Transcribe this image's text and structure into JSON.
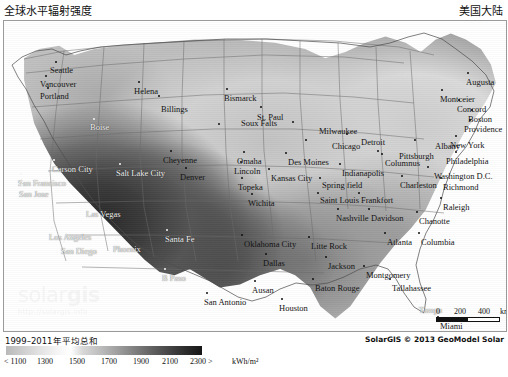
{
  "header": {
    "title_left": "全球水平辐射强度",
    "title_right": "美国大陆"
  },
  "map": {
    "watermark_brand_a": "solar",
    "watermark_brand_b": "gis",
    "watermark_url": "http://solargis.info",
    "cities": [
      {
        "name": "Seattle",
        "x": 52,
        "y": 41,
        "dx": -6,
        "dy": 4,
        "light": false
      },
      {
        "name": "Vancouver",
        "x": 42,
        "y": 55,
        "dx": -6,
        "dy": 4,
        "light": false
      },
      {
        "name": "Portland",
        "x": 44,
        "y": 67,
        "dx": -8,
        "dy": 4,
        "light": false
      },
      {
        "name": "Helena",
        "x": 135,
        "y": 61,
        "dx": -5,
        "dy": 5,
        "light": false
      },
      {
        "name": "Billings",
        "x": 155,
        "y": 75,
        "dx": 2,
        "dy": 9,
        "light": false
      },
      {
        "name": "Bismarck",
        "x": 223,
        "y": 68,
        "dx": -3,
        "dy": 5,
        "light": false
      },
      {
        "name": "St. Paul",
        "x": 257,
        "y": 86,
        "dx": -4,
        "dy": 6,
        "light": false
      },
      {
        "name": "Soux Falts",
        "x": 215,
        "y": 103,
        "dx": 22,
        "dy": -5,
        "light": false
      },
      {
        "name": "Milwaukee",
        "x": 289,
        "y": 101,
        "dx": 26,
        "dy": 5,
        "light": false
      },
      {
        "name": "Detroit",
        "x": 343,
        "y": 113,
        "dx": 14,
        "dy": 4,
        "light": false
      },
      {
        "name": "Boise",
        "x": 90,
        "y": 98,
        "dx": -4,
        "dy": 4,
        "light": true
      },
      {
        "name": "Chicago",
        "x": 302,
        "y": 119,
        "dx": 26,
        "dy": 2,
        "light": false
      },
      {
        "name": "Pittsburgh",
        "x": 374,
        "y": 130,
        "dx": 21,
        "dy": 1,
        "light": false
      },
      {
        "name": "Albany",
        "x": 411,
        "y": 119,
        "dx": 20,
        "dy": 2,
        "light": false
      },
      {
        "name": "Augusta",
        "x": 464,
        "y": 52,
        "dx": -2,
        "dy": 5,
        "light": false
      },
      {
        "name": "Montceier",
        "x": 438,
        "y": 69,
        "dx": -2,
        "dy": 5,
        "light": false
      },
      {
        "name": "Concord",
        "x": 455,
        "y": 79,
        "dx": -2,
        "dy": 5,
        "light": false
      },
      {
        "name": "Boston",
        "x": 468,
        "y": 89,
        "dx": -4,
        "dy": 5,
        "light": false
      },
      {
        "name": "Providence",
        "x": 466,
        "y": 99,
        "dx": -6,
        "dy": 5,
        "light": false
      },
      {
        "name": "New York",
        "x": 452,
        "y": 115,
        "dx": -6,
        "dy": 5,
        "light": false
      },
      {
        "name": "Philadelphia",
        "x": 452,
        "y": 131,
        "dx": -10,
        "dy": 5,
        "light": false
      },
      {
        "name": "Cheyenne",
        "x": 167,
        "y": 130,
        "dx": -8,
        "dy": 5,
        "light": false
      },
      {
        "name": "Omaha",
        "x": 240,
        "y": 131,
        "dx": -7,
        "dy": 5,
        "light": false
      },
      {
        "name": "Des Moines",
        "x": 282,
        "y": 132,
        "dx": 2,
        "dy": 5,
        "light": false
      },
      {
        "name": "Columnus",
        "x": 378,
        "y": 133,
        "dx": 3,
        "dy": 5,
        "light": false
      },
      {
        "name": "Salt Lake City",
        "x": 116,
        "y": 143,
        "dx": -4,
        "dy": 5,
        "light": true
      },
      {
        "name": "Lincoln",
        "x": 237,
        "y": 141,
        "dx": -7,
        "dy": 5,
        "light": false
      },
      {
        "name": "Denver",
        "x": 182,
        "y": 147,
        "dx": -6,
        "dy": 5,
        "light": false
      },
      {
        "name": "Indianapolis",
        "x": 336,
        "y": 143,
        "dx": 2,
        "dy": 5,
        "light": false
      },
      {
        "name": "Carson City",
        "x": 50,
        "y": 139,
        "dx": -2,
        "dy": 5,
        "light": true
      },
      {
        "name": "San Francisco",
        "x": 17,
        "y": 153,
        "dx": -3,
        "dy": 5,
        "light": true
      },
      {
        "name": "Washington D.C.",
        "x": 424,
        "y": 146,
        "dx": 6,
        "dy": 5,
        "light": false
      },
      {
        "name": "Topeka",
        "x": 238,
        "y": 157,
        "dx": -4,
        "dy": 5,
        "light": false
      },
      {
        "name": "Kansas City",
        "x": 265,
        "y": 148,
        "dx": 2,
        "dy": 5,
        "light": false
      },
      {
        "name": "Spring field",
        "x": 316,
        "y": 157,
        "dx": 2,
        "dy": 3,
        "light": false
      },
      {
        "name": "Charleston",
        "x": 398,
        "y": 155,
        "dx": -2,
        "dy": 5,
        "light": false
      },
      {
        "name": "Richmond",
        "x": 437,
        "y": 157,
        "dx": 2,
        "dy": 5,
        "light": false
      },
      {
        "name": "San Jose",
        "x": 18,
        "y": 164,
        "dx": -3,
        "dy": 5,
        "light": true
      },
      {
        "name": "Saint Louis",
        "x": 314,
        "y": 172,
        "dx": 2,
        "dy": 3,
        "light": false
      },
      {
        "name": "Frankfort",
        "x": 355,
        "y": 172,
        "dx": 2,
        "dy": 3,
        "light": false
      },
      {
        "name": "Wichita",
        "x": 248,
        "y": 173,
        "dx": -4,
        "dy": 5,
        "light": false
      },
      {
        "name": "Raleigh",
        "x": 437,
        "y": 177,
        "dx": 2,
        "dy": 5,
        "light": false
      },
      {
        "name": "Las Vegas",
        "x": 86,
        "y": 184,
        "dx": -4,
        "dy": 5,
        "light": true
      },
      {
        "name": "Nashville",
        "x": 334,
        "y": 188,
        "dx": -2,
        "dy": 5,
        "light": false
      },
      {
        "name": "Davidson",
        "x": 365,
        "y": 188,
        "dx": 2,
        "dy": 5,
        "light": false
      },
      {
        "name": "Chanotte",
        "x": 413,
        "y": 191,
        "dx": 2,
        "dy": 5,
        "light": false
      },
      {
        "name": "Los Angeles",
        "x": 48,
        "y": 207,
        "dx": -3,
        "dy": 5,
        "light": true
      },
      {
        "name": "Santa Fe",
        "x": 163,
        "y": 209,
        "dx": -2,
        "dy": 5,
        "light": true
      },
      {
        "name": "Oklahoma City",
        "x": 238,
        "y": 214,
        "dx": 2,
        "dy": 5,
        "light": false
      },
      {
        "name": "Litte Rock",
        "x": 305,
        "y": 216,
        "dx": 2,
        "dy": 5,
        "light": false
      },
      {
        "name": "Atlanta",
        "x": 381,
        "y": 212,
        "dx": 2,
        "dy": 5,
        "light": false
      },
      {
        "name": "Columbia",
        "x": 415,
        "y": 212,
        "dx": 2,
        "dy": 5,
        "light": false
      },
      {
        "name": "Phoenix",
        "x": 112,
        "y": 219,
        "dx": -3,
        "dy": 5,
        "light": true
      },
      {
        "name": "San Diego",
        "x": 60,
        "y": 221,
        "dx": -3,
        "dy": 5,
        "light": true
      },
      {
        "name": "Dallas",
        "x": 262,
        "y": 233,
        "dx": -3,
        "dy": 5,
        "light": false
      },
      {
        "name": "Jackson",
        "x": 322,
        "y": 236,
        "dx": 2,
        "dy": 5,
        "light": false
      },
      {
        "name": "B Paso",
        "x": 161,
        "y": 248,
        "dx": -3,
        "dy": 5,
        "light": true
      },
      {
        "name": "Montgomery",
        "x": 360,
        "y": 245,
        "dx": 2,
        "dy": 5,
        "light": false
      },
      {
        "name": "Ausan",
        "x": 251,
        "y": 260,
        "dx": -3,
        "dy": 5,
        "light": false
      },
      {
        "name": "Baton Rouge",
        "x": 309,
        "y": 258,
        "dx": 2,
        "dy": 5,
        "light": false
      },
      {
        "name": "Tallahassee",
        "x": 386,
        "y": 258,
        "dx": 2,
        "dy": 5,
        "light": false
      },
      {
        "name": "San Antonio",
        "x": 203,
        "y": 272,
        "dx": -3,
        "dy": 5,
        "light": false
      },
      {
        "name": "Houston",
        "x": 278,
        "y": 278,
        "dx": -3,
        "dy": 5,
        "light": false
      },
      {
        "name": "Tampa",
        "x": 413,
        "y": 280,
        "dx": 2,
        "dy": 5,
        "light": true
      },
      {
        "name": "Miami",
        "x": 434,
        "y": 296,
        "dx": 2,
        "dy": 5,
        "light": false
      }
    ],
    "scalebar": {
      "zero": "0",
      "mid": "200",
      "max": "400",
      "unit": "km"
    }
  },
  "footer": {
    "legend_title": "1999–2011年平均总和",
    "legend_unit": "kWh/m²",
    "legend_ticks": [
      "< 1100",
      "1300",
      "1500",
      "1700",
      "1900",
      "2100",
      "2300 >"
    ],
    "copyright": "SolarGIS © 2013 GeoModel Solar"
  },
  "chart_data": {
    "type": "heatmap",
    "title": "全球水平辐射强度",
    "subtitle": "美国大陆",
    "variable": "Global Horizontal Irradiation",
    "period": "1999–2011年平均总和",
    "unit": "kWh/m²",
    "colorbar_breaks": [
      1100,
      1300,
      1500,
      1700,
      1900,
      2100,
      2300
    ],
    "colorbar_labels": [
      "< 1100",
      "1300",
      "1500",
      "1700",
      "1900",
      "2100",
      "2300 >"
    ],
    "colorbar_min_label": "< 1100",
    "colorbar_max_label": "2300 >",
    "legend_position": "bottom-left",
    "grid": false,
    "scale_bar_km": [
      0,
      200,
      400
    ],
    "regional_values": [
      {
        "region": "Southwest (Arizona / Nevada / SE California)",
        "value": 2300
      },
      {
        "region": "New Mexico / West Texas",
        "value": 2100
      },
      {
        "region": "Southern California coast",
        "value": 2100
      },
      {
        "region": "Colorado Plateau / Utah",
        "value": 1900
      },
      {
        "region": "Central Texas / Oklahoma",
        "value": 1800
      },
      {
        "region": "Florida peninsula",
        "value": 1800
      },
      {
        "region": "Southeast (Georgia / Alabama)",
        "value": 1700
      },
      {
        "region": "Great Plains (Kansas / Nebraska)",
        "value": 1600
      },
      {
        "region": "Mid-Atlantic",
        "value": 1500
      },
      {
        "region": "Midwest (Illinois / Indiana / Ohio)",
        "value": 1400
      },
      {
        "region": "Northern Plains (Dakotas / Minnesota)",
        "value": 1300
      },
      {
        "region": "Northeast (New England)",
        "value": 1300
      },
      {
        "region": "Pacific Northwest (Washington / Oregon)",
        "value": 1100
      }
    ]
  }
}
